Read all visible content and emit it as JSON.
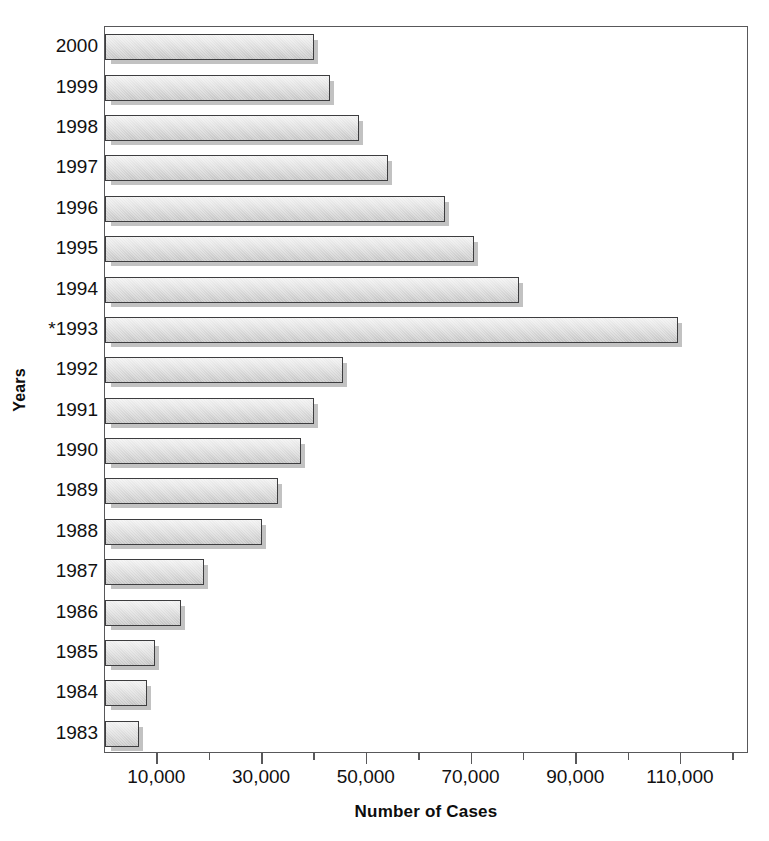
{
  "chart_data": {
    "type": "bar",
    "orientation": "horizontal",
    "title": "",
    "xlabel": "Number of Cases",
    "ylabel": "Years",
    "categories": [
      "2000",
      "1999",
      "1998",
      "1997",
      "1996",
      "1995",
      "1994",
      "*1993",
      "1992",
      "1991",
      "1990",
      "1989",
      "1988",
      "1987",
      "1986",
      "1985",
      "1984",
      "1983"
    ],
    "values": [
      40000,
      43000,
      48500,
      54000,
      65000,
      70500,
      79000,
      109500,
      45500,
      40000,
      37500,
      33000,
      30000,
      19000,
      14500,
      9500,
      8000,
      6500
    ],
    "xlim": [
      0,
      123000
    ],
    "ylim": null,
    "x_tick_values": [
      10000,
      20000,
      30000,
      40000,
      50000,
      60000,
      70000,
      80000,
      90000,
      100000,
      110000,
      120000
    ],
    "x_tick_labels": [
      "10,000",
      "",
      "30,000",
      "",
      "50,000",
      "",
      "70,000",
      "",
      "90,000",
      "",
      "110,000",
      ""
    ],
    "x_labeled_ticks": [
      {
        "value": 10000,
        "label": "10,000"
      },
      {
        "value": 30000,
        "label": "30,000"
      },
      {
        "value": 50000,
        "label": "50,000"
      },
      {
        "value": 70000,
        "label": "70,000"
      },
      {
        "value": 90000,
        "label": "90,000"
      },
      {
        "value": 110000,
        "label": "110,000"
      }
    ],
    "grid": false,
    "legend": false,
    "legend_position": "none",
    "annotations": [
      "* asterisk on the 1993 category label"
    ],
    "bar_face_color": "#dcdcdc",
    "bar_edge_color": "#3d3d3f",
    "bar_shadow_color": "#787878",
    "axis_color": "#58585a",
    "background_color": "#ffffff"
  }
}
